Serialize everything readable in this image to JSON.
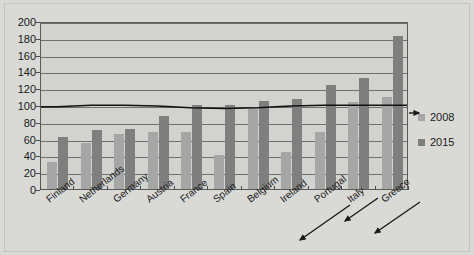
{
  "chart_data": {
    "type": "bar",
    "title": "",
    "subtitle": "",
    "xlabel": "",
    "ylabel": "",
    "ylim": [
      0,
      200
    ],
    "ytick_step": 20,
    "yticks": [
      "200",
      "180",
      "160",
      "140",
      "120",
      "100",
      "80",
      "60",
      "40",
      "20",
      "0"
    ],
    "grid": true,
    "legend_position": "right",
    "categories": [
      "Finland",
      "Netherlands",
      "Germany",
      "Austria",
      "France",
      "Spain",
      "Belgium",
      "Ireland",
      "Portugal",
      "Italy",
      "Greece"
    ],
    "series": [
      {
        "name": "2008",
        "color": "#a6a6a6",
        "values": [
          32,
          55,
          65,
          68,
          68,
          40,
          95,
          44,
          68,
          103,
          109
        ]
      },
      {
        "name": "2015",
        "color": "#7f7f7f",
        "values": [
          62,
          70,
          72,
          87,
          100,
          100,
          105,
          107,
          124,
          132,
          182
        ]
      },
      {
        "name": "reference-line",
        "type": "line",
        "color": "#111111",
        "values": [
          99,
          101,
          101,
          100,
          98,
          97,
          98,
          100,
          101,
          101,
          101
        ]
      }
    ],
    "annotations": [
      {
        "name": "arrow-portugal",
        "label": ""
      },
      {
        "name": "arrow-italy",
        "label": ""
      },
      {
        "name": "arrow-greece",
        "label": ""
      },
      {
        "name": "arrow-line-end",
        "label": ""
      }
    ]
  },
  "legend": {
    "items": [
      {
        "label": "2008",
        "color": "#a6a6a6"
      },
      {
        "label": "2015",
        "color": "#7f7f7f"
      }
    ]
  },
  "colors": {
    "background": "#d9d9d6",
    "plot_background": "#d2d2cf",
    "axis": "#5a5a5a",
    "gridline": "#6f6f6f",
    "series_2008": "#a6a6a6",
    "series_2015": "#7f7f7f",
    "line": "#111111",
    "text": "#1a1a1a"
  }
}
